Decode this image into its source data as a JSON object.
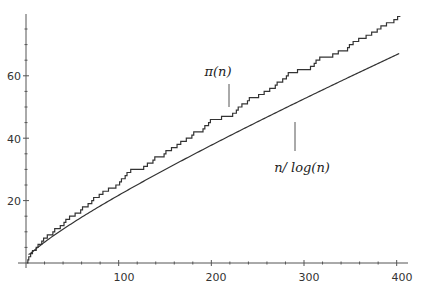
{
  "chart_data": {
    "type": "line",
    "title": "",
    "xlabel": "",
    "ylabel": "",
    "xlim": [
      0,
      405
    ],
    "ylim": [
      0,
      78
    ],
    "grid": false,
    "legend": null,
    "x_ticks": [
      100,
      200,
      300,
      400
    ],
    "x_tick_labels": [
      "100",
      "200",
      "300",
      "400"
    ],
    "y_ticks": [
      20,
      40,
      60
    ],
    "y_tick_labels": [
      "20",
      "40",
      "60"
    ],
    "series": [
      {
        "name": "π(n)",
        "kind": "step",
        "description": "prime counting function",
        "x": [
          2,
          3,
          5,
          7,
          11,
          13,
          17,
          19,
          23,
          29,
          31,
          37,
          41,
          43,
          47,
          53,
          59,
          61,
          67,
          71,
          73,
          79,
          83,
          89,
          97,
          101,
          103,
          107,
          109,
          113,
          127,
          131,
          137,
          139,
          149,
          151,
          157,
          163,
          167,
          173,
          179,
          181,
          191,
          193,
          197,
          199,
          211,
          223,
          227,
          229,
          233,
          239,
          241,
          251,
          257,
          263,
          269,
          271,
          277,
          281,
          283,
          293,
          307,
          311,
          313,
          317,
          331,
          337,
          347,
          349,
          353,
          359,
          367,
          373,
          379,
          383,
          389,
          397,
          401
        ],
        "values": [
          1,
          2,
          3,
          4,
          5,
          6,
          7,
          8,
          9,
          10,
          11,
          12,
          13,
          14,
          15,
          16,
          17,
          18,
          19,
          20,
          21,
          22,
          23,
          24,
          25,
          26,
          27,
          28,
          29,
          30,
          31,
          32,
          33,
          34,
          35,
          36,
          37,
          38,
          39,
          40,
          41,
          42,
          43,
          44,
          45,
          46,
          47,
          48,
          49,
          50,
          51,
          52,
          53,
          54,
          55,
          56,
          57,
          58,
          59,
          60,
          61,
          62,
          63,
          64,
          65,
          66,
          67,
          68,
          69,
          70,
          71,
          72,
          73,
          74,
          75,
          76,
          77,
          78,
          79
        ]
      },
      {
        "name": "n/log(n)",
        "kind": "smooth",
        "x": [
          3,
          10,
          25,
          50,
          75,
          100,
          150,
          200,
          250,
          300,
          350,
          400
        ],
        "values": [
          2.73,
          4.34,
          7.77,
          12.78,
          17.37,
          21.71,
          29.94,
          37.75,
          45.28,
          52.6,
          59.74,
          66.76
        ]
      }
    ],
    "annotations": [
      {
        "text": "π(n)",
        "target_series": "π(n)",
        "label_x": 213,
        "label_y": 72
      },
      {
        "text": "n/ log(n)",
        "target_series": "n/log(n)",
        "label_x": 290,
        "label_y": 170
      }
    ]
  },
  "labels": {
    "pi": "π(n)",
    "nlog": "n/ log(n)",
    "x100": "100",
    "x200": "200",
    "x300": "300",
    "x400": "400",
    "y20": "20",
    "y40": "40",
    "y60": "60"
  }
}
